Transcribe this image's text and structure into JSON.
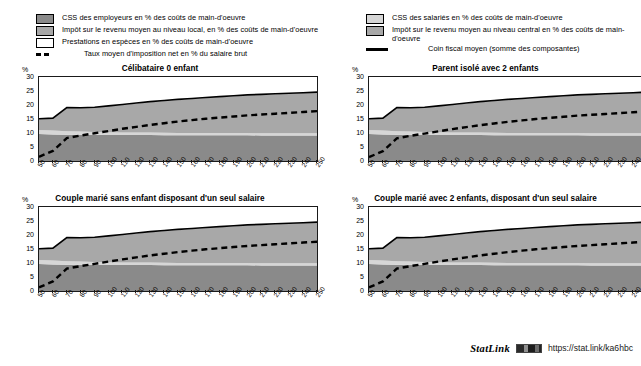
{
  "legend": {
    "left_items": [
      {
        "swatch": "dark-gray-square",
        "label": "CSS des employeurs en % des coûts de main-d'oeuvre"
      },
      {
        "swatch": "mid-gray-square",
        "label": "Impôt sur le revenu moyen au niveau local, en % des coûts de main-d'oeuvre"
      },
      {
        "swatch": "white-square",
        "label": "Prestations en espèces en % des coûts de main-d'oeuvre"
      },
      {
        "swatch": "dashed-line",
        "label": "Taux moyen d'imposition net en % du salaire brut"
      }
    ],
    "right_items": [
      {
        "swatch": "light-gray-square",
        "label": "CSS des salariés en % des coûts de main-d'oeuvre"
      },
      {
        "swatch": "mid-gray-square",
        "label": "Impôt sur le revenu moyen au niveau central en %  des coûts de main-d'oeuvre"
      },
      {
        "swatch": "solid-line",
        "label": "Coin fiscal moyen (somme des composantes)"
      }
    ]
  },
  "axis": {
    "y_unit": "%",
    "y_ticks": [
      "0",
      "5",
      "10",
      "15",
      "20",
      "25",
      "30"
    ],
    "x_ticks": [
      "50",
      "60",
      "70",
      "80",
      "90",
      "100",
      "110",
      "120",
      "130",
      "140",
      "150",
      "160",
      "170",
      "180",
      "190",
      "200",
      "210",
      "220",
      "230",
      "240",
      "250"
    ]
  },
  "panels": [
    {
      "id": "celibataire-0-enfant",
      "title": "Célibataire 0 enfant"
    },
    {
      "id": "parent-isole-2-enfants",
      "title": "Parent isolé avec 2 enfants"
    },
    {
      "id": "couple-marie-sans-enfant",
      "title": "Couple marié sans enfant disposant d'un seul salaire"
    },
    {
      "id": "couple-marie-2-enfants",
      "title": "Couple marié avec 2 enfants, disposant d'un seul salaire"
    }
  ],
  "footer": {
    "statlink_label": "StatLink",
    "icon": "statlink-barcode-icon",
    "url": "https://stat.link/ka6hbc"
  },
  "colors": {
    "employer_ssc": "#8a8a8a",
    "employee_ssc": "#d6d6d6",
    "income_tax_central": "#a8a8a8",
    "income_tax_local": "#a8a8a8",
    "cash_benefits": "#ffffff",
    "net_tax_rate_line": "#000000",
    "tax_wedge_line": "#000000",
    "axis": "#1a1a1a"
  },
  "chart_data": {
    "type": "area",
    "title": "",
    "xlabel": "",
    "ylabel": "%",
    "ylim": [
      0,
      30
    ],
    "xlim": [
      50,
      250
    ],
    "grid": false,
    "legend_position": "top",
    "x": [
      50,
      60,
      70,
      80,
      90,
      100,
      110,
      120,
      130,
      140,
      150,
      160,
      170,
      180,
      190,
      200,
      210,
      220,
      230,
      240,
      250
    ],
    "panels": [
      {
        "name": "Célibataire 0 enfant",
        "series": [
          {
            "name": "CSS des employeurs en % des coûts de main-d'oeuvre",
            "values": [
              9.6,
              9.5,
              9.4,
              9.4,
              9.4,
              9.3,
              9.3,
              9.3,
              9.3,
              9.2,
              9.2,
              9.2,
              9.2,
              9.2,
              9.2,
              9.2,
              9.1,
              9.1,
              9.1,
              9.1,
              9.1
            ]
          },
          {
            "name": "CSS des salariés en % des coûts de main-d'oeuvre",
            "values": [
              1.5,
              1.4,
              1.2,
              1.1,
              1.0,
              1.0,
              0.9,
              0.9,
              0.9,
              0.9,
              0.8,
              0.8,
              0.8,
              0.8,
              0.8,
              0.8,
              0.8,
              0.8,
              0.8,
              0.8,
              0.8
            ]
          },
          {
            "name": "Impôt sur le revenu moyen au niveau central en %  des coûts de main-d'oeuvre",
            "values": [
              3.9,
              4.3,
              8.4,
              8.5,
              8.8,
              9.3,
              9.8,
              10.3,
              10.8,
              11.3,
              11.7,
              12.1,
              12.5,
              12.8,
              13.1,
              13.4,
              13.7,
              13.9,
              14.2,
              14.4,
              14.6
            ]
          },
          {
            "name": "Impôt sur le revenu moyen au niveau local, en % des coûts de main-d'oeuvre",
            "values": [
              0.0,
              0.0,
              0.0,
              0.0,
              0.0,
              0.0,
              0.0,
              0.0,
              0.0,
              0.0,
              0.0,
              0.0,
              0.0,
              0.0,
              0.0,
              0.0,
              0.0,
              0.0,
              0.0,
              0.0,
              0.0
            ]
          },
          {
            "name": "Prestations en espèces en % des coûts de main-d'oeuvre",
            "values": [
              0.0,
              0.0,
              0.0,
              0.0,
              0.0,
              0.0,
              0.0,
              0.0,
              0.0,
              0.0,
              0.0,
              0.0,
              0.0,
              0.0,
              0.0,
              0.0,
              0.0,
              0.0,
              0.0,
              0.0,
              0.0
            ]
          }
        ],
        "lines": [
          {
            "name": "Coin fiscal moyen (somme des composantes)",
            "values": [
              15.1,
              15.3,
              19.1,
              19.0,
              19.2,
              19.7,
              20.2,
              20.7,
              21.2,
              21.6,
              22.0,
              22.3,
              22.7,
              23.0,
              23.3,
              23.6,
              23.8,
              24.0,
              24.2,
              24.4,
              24.6
            ]
          },
          {
            "name": "Taux moyen d'imposition net en % du salaire brut",
            "values": [
              1.5,
              3.6,
              8.2,
              9.1,
              9.9,
              10.7,
              11.5,
              12.2,
              12.9,
              13.5,
              14.1,
              14.6,
              15.1,
              15.5,
              15.9,
              16.3,
              16.6,
              16.9,
              17.2,
              17.5,
              17.8
            ]
          }
        ]
      },
      {
        "name": "Parent isolé avec 2 enfants",
        "series": [
          {
            "name": "CSS des employeurs en % des coûts de main-d'oeuvre",
            "values": [
              9.6,
              9.5,
              9.4,
              9.4,
              9.4,
              9.3,
              9.3,
              9.3,
              9.3,
              9.2,
              9.2,
              9.2,
              9.2,
              9.2,
              9.2,
              9.2,
              9.1,
              9.1,
              9.1,
              9.1,
              9.1
            ]
          },
          {
            "name": "CSS des salariés en % des coûts de main-d'oeuvre",
            "values": [
              1.5,
              1.4,
              1.2,
              1.1,
              1.0,
              1.0,
              0.9,
              0.9,
              0.9,
              0.9,
              0.8,
              0.8,
              0.8,
              0.8,
              0.8,
              0.8,
              0.8,
              0.8,
              0.8,
              0.8,
              0.8
            ]
          },
          {
            "name": "Impôt sur le revenu moyen au niveau central en %  des coûts de main-d'oeuvre",
            "values": [
              3.9,
              4.3,
              8.4,
              8.5,
              8.8,
              9.3,
              9.8,
              10.3,
              10.8,
              11.3,
              11.7,
              12.1,
              12.5,
              12.8,
              13.1,
              13.4,
              13.7,
              13.9,
              14.2,
              14.4,
              14.6
            ]
          },
          {
            "name": "Impôt sur le revenu moyen au niveau local, en % des coûts de main-d'oeuvre",
            "values": [
              0.0,
              0.0,
              0.0,
              0.0,
              0.0,
              0.0,
              0.0,
              0.0,
              0.0,
              0.0,
              0.0,
              0.0,
              0.0,
              0.0,
              0.0,
              0.0,
              0.0,
              0.0,
              0.0,
              0.0,
              0.0
            ]
          },
          {
            "name": "Prestations en espèces en % des coûts de main-d'oeuvre",
            "values": [
              0.0,
              0.0,
              0.0,
              0.0,
              0.0,
              0.0,
              0.0,
              0.0,
              0.0,
              0.0,
              0.0,
              0.0,
              0.0,
              0.0,
              0.0,
              0.0,
              0.0,
              0.0,
              0.0,
              0.0,
              0.0
            ]
          }
        ],
        "lines": [
          {
            "name": "Coin fiscal moyen (somme des composantes)",
            "values": [
              15.1,
              15.3,
              19.1,
              19.0,
              19.2,
              19.7,
              20.2,
              20.7,
              21.2,
              21.6,
              22.0,
              22.3,
              22.7,
              23.0,
              23.3,
              23.6,
              23.8,
              24.0,
              24.2,
              24.4,
              24.6
            ]
          },
          {
            "name": "Taux moyen d'imposition net en % du salaire brut",
            "values": [
              1.4,
              3.5,
              8.1,
              9.0,
              9.8,
              10.6,
              11.4,
              12.1,
              12.8,
              13.4,
              14.0,
              14.5,
              15.0,
              15.4,
              15.8,
              16.2,
              16.5,
              16.8,
              17.1,
              17.4,
              17.7
            ]
          }
        ]
      },
      {
        "name": "Couple marié sans enfant disposant d'un seul salaire",
        "series": [
          {
            "name": "CSS des employeurs en % des coûts de main-d'oeuvre",
            "values": [
              9.6,
              9.5,
              9.4,
              9.4,
              9.4,
              9.3,
              9.3,
              9.3,
              9.3,
              9.2,
              9.2,
              9.2,
              9.2,
              9.2,
              9.2,
              9.2,
              9.1,
              9.1,
              9.1,
              9.1,
              9.1
            ]
          },
          {
            "name": "CSS des salariés en % des coûts de main-d'oeuvre",
            "values": [
              1.5,
              1.4,
              1.2,
              1.1,
              1.0,
              1.0,
              0.9,
              0.9,
              0.9,
              0.9,
              0.8,
              0.8,
              0.8,
              0.8,
              0.8,
              0.8,
              0.8,
              0.8,
              0.8,
              0.8,
              0.8
            ]
          },
          {
            "name": "Impôt sur le revenu moyen au niveau central en %  des coûts de main-d'oeuvre",
            "values": [
              3.9,
              4.3,
              8.4,
              8.5,
              8.8,
              9.3,
              9.8,
              10.3,
              10.8,
              11.3,
              11.7,
              12.1,
              12.5,
              12.8,
              13.1,
              13.4,
              13.7,
              13.9,
              14.2,
              14.4,
              14.6
            ]
          },
          {
            "name": "Impôt sur le revenu moyen au niveau local, en % des coûts de main-d'oeuvre",
            "values": [
              0.0,
              0.0,
              0.0,
              0.0,
              0.0,
              0.0,
              0.0,
              0.0,
              0.0,
              0.0,
              0.0,
              0.0,
              0.0,
              0.0,
              0.0,
              0.0,
              0.0,
              0.0,
              0.0,
              0.0,
              0.0
            ]
          },
          {
            "name": "Prestations en espèces en % des coûts de main-d'oeuvre",
            "values": [
              0.0,
              0.0,
              0.0,
              0.0,
              0.0,
              0.0,
              0.0,
              0.0,
              0.0,
              0.0,
              0.0,
              0.0,
              0.0,
              0.0,
              0.0,
              0.0,
              0.0,
              0.0,
              0.0,
              0.0,
              0.0
            ]
          }
        ],
        "lines": [
          {
            "name": "Coin fiscal moyen (somme des composantes)",
            "values": [
              15.1,
              15.3,
              19.1,
              19.0,
              19.2,
              19.7,
              20.2,
              20.7,
              21.2,
              21.6,
              22.0,
              22.3,
              22.7,
              23.0,
              23.3,
              23.6,
              23.8,
              24.0,
              24.2,
              24.4,
              24.6
            ]
          },
          {
            "name": "Taux moyen d'imposition net en % du salaire brut",
            "values": [
              1.3,
              3.4,
              8.0,
              8.9,
              9.7,
              10.5,
              11.3,
              12.0,
              12.7,
              13.3,
              13.9,
              14.4,
              14.9,
              15.3,
              15.7,
              16.1,
              16.4,
              16.7,
              17.0,
              17.3,
              17.6
            ]
          }
        ]
      },
      {
        "name": "Couple marié avec 2 enfants, disposant d'un seul salaire",
        "series": [
          {
            "name": "CSS des employeurs en % des coûts de main-d'oeuvre",
            "values": [
              9.6,
              9.5,
              9.4,
              9.4,
              9.4,
              9.3,
              9.3,
              9.3,
              9.3,
              9.2,
              9.2,
              9.2,
              9.2,
              9.2,
              9.2,
              9.2,
              9.1,
              9.1,
              9.1,
              9.1,
              9.1
            ]
          },
          {
            "name": "CSS des salariés en % des coûts de main-d'oeuvre",
            "values": [
              1.5,
              1.4,
              1.2,
              1.1,
              1.0,
              1.0,
              0.9,
              0.9,
              0.9,
              0.9,
              0.8,
              0.8,
              0.8,
              0.8,
              0.8,
              0.8,
              0.8,
              0.8,
              0.8,
              0.8,
              0.8
            ]
          },
          {
            "name": "Impôt sur le revenu moyen au niveau central en %  des coûts de main-d'oeuvre",
            "values": [
              3.9,
              4.3,
              8.4,
              8.5,
              8.8,
              9.3,
              9.8,
              10.3,
              10.8,
              11.3,
              11.7,
              12.1,
              12.5,
              12.8,
              13.1,
              13.4,
              13.7,
              13.9,
              14.2,
              14.4,
              14.6
            ]
          },
          {
            "name": "Impôt sur le revenu moyen au niveau local, en % des coûts de main-d'oeuvre",
            "values": [
              0.0,
              0.0,
              0.0,
              0.0,
              0.0,
              0.0,
              0.0,
              0.0,
              0.0,
              0.0,
              0.0,
              0.0,
              0.0,
              0.0,
              0.0,
              0.0,
              0.0,
              0.0,
              0.0,
              0.0,
              0.0
            ]
          },
          {
            "name": "Prestations en espèces en % des coûts de main-d'oeuvre",
            "values": [
              0.0,
              0.0,
              0.0,
              0.0,
              0.0,
              0.0,
              0.0,
              0.0,
              0.0,
              0.0,
              0.0,
              0.0,
              0.0,
              0.0,
              0.0,
              0.0,
              0.0,
              0.0,
              0.0,
              0.0,
              0.0
            ]
          }
        ],
        "lines": [
          {
            "name": "Coin fiscal moyen (somme des composantes)",
            "values": [
              15.1,
              15.3,
              19.1,
              19.0,
              19.2,
              19.7,
              20.2,
              20.7,
              21.2,
              21.6,
              22.0,
              22.3,
              22.7,
              23.0,
              23.3,
              23.6,
              23.8,
              24.0,
              24.2,
              24.4,
              24.6
            ]
          },
          {
            "name": "Taux moyen d'imposition net en % du salaire brut",
            "values": [
              1.3,
              3.4,
              8.0,
              8.9,
              9.7,
              10.5,
              11.3,
              12.0,
              12.7,
              13.3,
              13.9,
              14.4,
              14.9,
              15.3,
              15.7,
              16.1,
              16.4,
              16.7,
              17.0,
              17.3,
              17.6
            ]
          }
        ]
      }
    ]
  }
}
